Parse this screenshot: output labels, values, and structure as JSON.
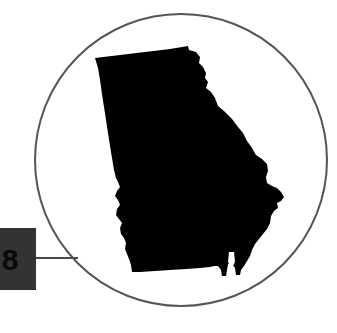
{
  "figure": {
    "background_color": "#ffffff"
  },
  "callout_circle": {
    "name": "circular callout frame",
    "stroke_color": "#555555",
    "fill_color": "#ffffff",
    "stroke_width": 2,
    "center_x": 181,
    "center_y": 160,
    "radius": 146
  },
  "leader_line": {
    "name": "connector leader line",
    "stroke_color": "#4a4a4a",
    "stroke_width": 2,
    "x1": 36,
    "y1": 258,
    "x2": 78,
    "y2": 258
  },
  "label_box": {
    "name": "cropped label chip",
    "fill_color": "#333333",
    "text": "8",
    "text_color": "#0a0a0a",
    "x": -16,
    "y": 228,
    "width": 52,
    "height": 62,
    "cropped_at_left_edge": true
  },
  "state_shape": {
    "name": "Georgia",
    "fill_color": "#000000",
    "path": "M95,58 L170,49 L188,46 L189,50 L196,52 L200,57 L199,63 L203,67 L206,73 L205,78 L208,82 L206,88 L211,92 L215,98 L218,106 L224,111 L232,119 L238,127 L243,133 L247,141 L252,148 L256,155 L262,159 L267,164 L268,171 L266,177 L267,183 L272,186 L277,188 L281,192 L284,197 L281,201 L277,203 L278,208 L274,211 L271,216 L270,223 L267,229 L263,234 L259,239 L255,244 L252,250 L250,256 L247,261 L244,266 L241,270 L240,275 L236,275 L235,268 L232,264 L228,264 L227,270 L226,276 L222,276 L221,270 L218,266 L214,266 L210,267 L200,268 L186,269 L170,270 L155,271 L140,272 L132,272 L131,265 L129,259 L127,254 L125,249 L126,243 L124,238 L121,234 L120,228 L122,223 L119,219 L116,215 L117,209 L120,205 L118,200 L115,196 L117,191 L120,187 L118,182 L116,178 L114,170 L112,158 L110,146 L108,133 L106,120 L104,107 L102,94 L100,80 L98,68 Z"
  },
  "state_shape_notch": {
    "name": "southeast river notch",
    "fill_color": "#ffffff",
    "path": "M229,252 L234,252 L235,262 L233,266 L230,266 L228,262 Z"
  }
}
